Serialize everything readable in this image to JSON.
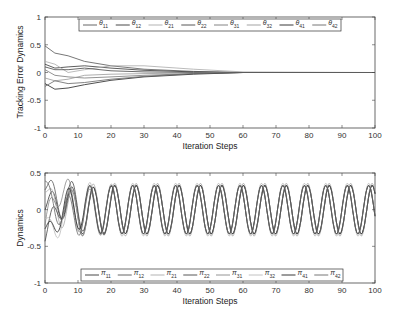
{
  "chart_data": [
    {
      "type": "line",
      "title": "",
      "xlabel": "Iteration Steps",
      "ylabel": "Tracking Error Dynamics",
      "xlim": [
        0,
        100
      ],
      "ylim": [
        -1,
        1
      ],
      "xticks": [
        0,
        10,
        20,
        30,
        40,
        50,
        60,
        70,
        80,
        90,
        100
      ],
      "yticks": [
        -1,
        -0.5,
        0,
        0.5,
        1
      ],
      "ytick_labels": [
        "-1",
        "-0.5",
        "0",
        "0.5",
        "1"
      ],
      "grid": false,
      "legend_position": "top (horizontal, inside)",
      "legend": [
        "θ11",
        "θ12",
        "θ21",
        "θ22",
        "θ31",
        "θ32",
        "θ41",
        "θ42"
      ],
      "series": [
        {
          "name": "θ11",
          "color": "#555555",
          "x": [
            0,
            3,
            7,
            12,
            20,
            30,
            45,
            60,
            100
          ],
          "values": [
            0.48,
            0.35,
            0.3,
            0.2,
            0.12,
            0.06,
            0.02,
            0.0,
            0.0
          ]
        },
        {
          "name": "θ12",
          "color": "#333333",
          "x": [
            0,
            3,
            7,
            12,
            20,
            30,
            45,
            60,
            100
          ],
          "values": [
            0.15,
            0.08,
            0.1,
            0.12,
            0.08,
            0.04,
            0.01,
            0.0,
            0.0
          ]
        },
        {
          "name": "θ21",
          "color": "#aaaaaa",
          "x": [
            0,
            3,
            7,
            12,
            20,
            30,
            45,
            60,
            100
          ],
          "values": [
            0.2,
            0.15,
            0.0,
            0.05,
            0.12,
            0.12,
            0.06,
            0.01,
            0.0
          ]
        },
        {
          "name": "θ22",
          "color": "#444444",
          "x": [
            0,
            3,
            7,
            12,
            20,
            30,
            45,
            60,
            100
          ],
          "values": [
            0.1,
            0.05,
            0.05,
            0.08,
            0.03,
            0.01,
            0.0,
            0.0,
            0.0
          ]
        },
        {
          "name": "θ31",
          "color": "#777777",
          "x": [
            0,
            3,
            7,
            12,
            20,
            30,
            45,
            60,
            100
          ],
          "values": [
            0.05,
            -0.05,
            -0.08,
            -0.1,
            -0.08,
            -0.05,
            -0.02,
            0.0,
            0.0
          ]
        },
        {
          "name": "θ32",
          "color": "#999999",
          "x": [
            0,
            3,
            7,
            12,
            20,
            30,
            45,
            60,
            100
          ],
          "values": [
            -0.1,
            -0.15,
            -0.12,
            -0.05,
            -0.03,
            -0.02,
            -0.01,
            0.0,
            0.0
          ]
        },
        {
          "name": "θ41",
          "color": "#222222",
          "x": [
            0,
            3,
            7,
            12,
            20,
            30,
            45,
            60,
            100
          ],
          "values": [
            -0.2,
            -0.3,
            -0.28,
            -0.22,
            -0.14,
            -0.08,
            -0.03,
            0.0,
            0.0
          ]
        },
        {
          "name": "θ42",
          "color": "#666666",
          "x": [
            0,
            3,
            7,
            12,
            20,
            30,
            45,
            60,
            100
          ],
          "values": [
            -0.25,
            -0.15,
            -0.2,
            -0.18,
            -0.12,
            -0.07,
            -0.02,
            0.0,
            0.0
          ]
        }
      ]
    },
    {
      "type": "line",
      "title": "",
      "xlabel": "Iteration Steps",
      "ylabel": "Dynamics",
      "xlim": [
        0,
        100
      ],
      "ylim": [
        -1,
        0.5
      ],
      "xticks": [
        0,
        10,
        20,
        30,
        40,
        50,
        60,
        70,
        80,
        90,
        100
      ],
      "yticks": [
        -1,
        -0.5,
        0,
        0.5
      ],
      "ytick_labels": [
        "-1",
        "-0.5",
        "0",
        "0.5"
      ],
      "grid": false,
      "legend_position": "bottom (horizontal, inside)",
      "legend": [
        "π11",
        "π12",
        "π21",
        "π22",
        "π31",
        "π32",
        "π41",
        "π42"
      ],
      "series_description": "Sinusoidal oscillations with period ≈ 6.5 steps, steady-state amplitude ≈ 0.33; initial transients up to +0.42 and -0.65 within the first ~15 steps; curves settle into two phase-shifted groups.",
      "series": [
        {
          "name": "π11",
          "color": "#333333",
          "amplitude": 0.33,
          "period": 6.5,
          "phase": 0.0,
          "initial_peak": 0.3
        },
        {
          "name": "π12",
          "color": "#555555",
          "amplitude": 0.33,
          "period": 6.5,
          "phase": 0.0,
          "initial_peak": 0.42
        },
        {
          "name": "π21",
          "color": "#aaaaaa",
          "amplitude": 0.36,
          "period": 6.5,
          "phase": 0.0,
          "initial_peak": 0.25
        },
        {
          "name": "π22",
          "color": "#444444",
          "amplitude": 0.33,
          "period": 6.5,
          "phase": 0.0,
          "initial_peak": -0.5
        },
        {
          "name": "π31",
          "color": "#888888",
          "amplitude": 0.33,
          "period": 6.5,
          "phase": 1.0,
          "initial_peak": -0.65
        },
        {
          "name": "π32",
          "color": "#bbbbbb",
          "amplitude": 0.36,
          "period": 6.5,
          "phase": 1.0,
          "initial_peak": 0.35
        },
        {
          "name": "π41",
          "color": "#222222",
          "amplitude": 0.33,
          "period": 6.5,
          "phase": 1.0,
          "initial_peak": 0.3
        },
        {
          "name": "π42",
          "color": "#666666",
          "amplitude": 0.33,
          "period": 6.5,
          "phase": 1.0,
          "initial_peak": -0.4
        }
      ]
    }
  ]
}
